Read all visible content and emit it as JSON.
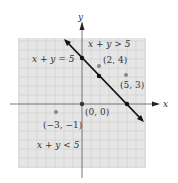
{
  "figure": {
    "type": "linear-inequality-graph",
    "axes": {
      "x_label": "x",
      "y_label": "y"
    },
    "grid": {
      "x_min": -7,
      "x_max": 7,
      "y_min": -7,
      "y_max": 7,
      "step": 1
    },
    "boundary": {
      "equation": "x + y = 5",
      "points_on_line": [
        [
          0,
          5
        ],
        [
          2,
          3
        ],
        [
          5,
          0
        ]
      ]
    },
    "region_labels": {
      "above": "x + y > 5",
      "below": "x + y < 5"
    },
    "test_points": [
      {
        "label": "(2, 4)",
        "x": 2,
        "y": 4
      },
      {
        "label": "(5, 3)",
        "x": 5,
        "y": 3
      },
      {
        "label": "(0, 0)",
        "x": 0,
        "y": 0
      },
      {
        "label": "(−3, −1)",
        "x": -3,
        "y": -1
      }
    ],
    "colors": {
      "grid_bg": "#e6e6e6",
      "grid_line": "#c8c8c8",
      "line": "#111111",
      "point": "#888888"
    }
  }
}
